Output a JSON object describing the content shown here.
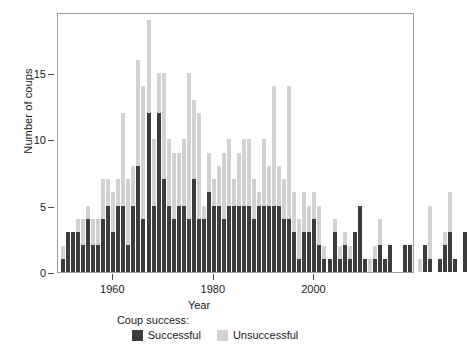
{
  "chart_data": {
    "type": "bar",
    "stacked": true,
    "title": "",
    "xlabel": "Year",
    "ylabel": "Number of coups",
    "xlim": [
      1949,
      2020
    ],
    "ylim": [
      0,
      19.6
    ],
    "grid": false,
    "legend_title": "Coup success:",
    "legend_position": "bottom",
    "xticks": [
      1960,
      1980,
      2000
    ],
    "yticks": [
      0,
      5,
      10,
      15
    ],
    "colors": {
      "successful": "#3c3c3c",
      "unsuccessful": "#d2d2d2",
      "frame": "#9b9b9b"
    },
    "series": [
      {
        "name": "Successful",
        "color": "#3c3c3c",
        "values": [
          1,
          3,
          3,
          3,
          2,
          4,
          2,
          2,
          4,
          5,
          3,
          5,
          5,
          2,
          5,
          8,
          4,
          12,
          5,
          12,
          7,
          5,
          4,
          5,
          5,
          4,
          7,
          4,
          4,
          6,
          5,
          5,
          4,
          5,
          5,
          5,
          5,
          5,
          4,
          5,
          5,
          5,
          5,
          5,
          4,
          4,
          3,
          1,
          3,
          3,
          4,
          2,
          1,
          1,
          3,
          1,
          2,
          1,
          3,
          5,
          1,
          0,
          1,
          2,
          1,
          2,
          0,
          0,
          2,
          2,
          0,
          0,
          2,
          1,
          0,
          1,
          2,
          3,
          1,
          0,
          3
        ]
      },
      {
        "name": "Unsuccessful",
        "color": "#d2d2d2",
        "values": [
          1,
          0,
          0,
          1,
          2,
          1,
          2,
          2,
          3,
          2,
          3,
          2,
          7,
          5,
          3,
          8,
          10,
          7,
          5,
          3,
          8,
          5,
          5,
          4,
          5,
          11,
          6,
          8,
          1,
          3,
          2,
          3,
          5,
          5,
          2,
          4,
          5,
          5,
          3,
          1,
          5,
          3,
          9,
          3,
          3,
          10,
          3,
          3,
          3,
          2,
          2,
          3,
          1,
          0,
          1,
          1,
          1,
          1,
          0,
          0,
          0,
          1,
          1,
          2,
          0,
          0,
          0,
          0,
          0,
          0,
          0,
          1,
          0,
          4,
          0,
          0,
          1,
          3,
          0,
          0,
          0
        ]
      }
    ],
    "x": [
      1950,
      1951,
      1952,
      1953,
      1954,
      1955,
      1956,
      1957,
      1958,
      1959,
      1960,
      1961,
      1962,
      1963,
      1964,
      1965,
      1966,
      1967,
      1968,
      1969,
      1970,
      1971,
      1972,
      1973,
      1974,
      1975,
      1976,
      1977,
      1978,
      1979,
      1980,
      1981,
      1982,
      1983,
      1984,
      1985,
      1986,
      1987,
      1988,
      1989,
      1990,
      1991,
      1992,
      1993,
      1994,
      1995,
      1996,
      1997,
      1998,
      1999,
      2000,
      2001,
      2002,
      2003,
      2004,
      2005,
      2006,
      2007,
      2008,
      2009,
      2010,
      2011,
      2012,
      2013,
      2014,
      2015,
      2016,
      2017,
      2018,
      2019,
      2020,
      2021,
      2022,
      2023,
      2024,
      2025,
      2026,
      2027,
      2028,
      2029,
      2030
    ]
  },
  "axis": {
    "y_title": "Number of coups",
    "x_title": "Year",
    "y_ticks": [
      "0",
      "5",
      "10",
      "15"
    ],
    "x_ticks": [
      "1960",
      "1980",
      "2000"
    ]
  },
  "legend": {
    "title": "Coup success:",
    "items": [
      {
        "label": "Successful",
        "color": "#3c3c3c"
      },
      {
        "label": "Unsuccessful",
        "color": "#d2d2d2"
      }
    ]
  }
}
